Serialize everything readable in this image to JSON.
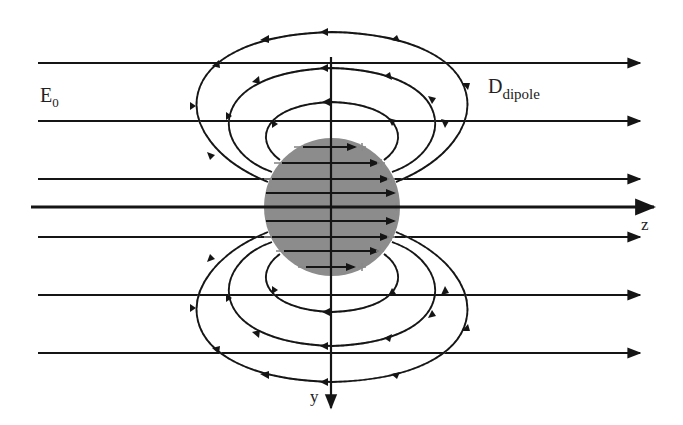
{
  "figure": {
    "title": "",
    "labels": {
      "applied_field": "E",
      "applied_field_sub": "0",
      "dipole_field": "D",
      "dipole_field_sub": "dipole",
      "z_axis": "z",
      "y_axis": "y",
      "plus_sign": "+",
      "minus_sign": "−"
    },
    "colors": {
      "background": "#ffffff",
      "line": "#151515",
      "sphere": "#8c8c8c",
      "dashed": "#9a9a9a"
    },
    "field_lines_y": [
      63,
      121,
      179,
      237,
      295,
      353
    ],
    "z_axis_y": 207,
    "sphere": {
      "cx": 332,
      "cy": 207,
      "rx": 68,
      "ry": 69
    },
    "internal_lines_y": [
      147,
      163,
      179,
      193,
      207,
      221,
      237,
      251,
      267
    ]
  }
}
